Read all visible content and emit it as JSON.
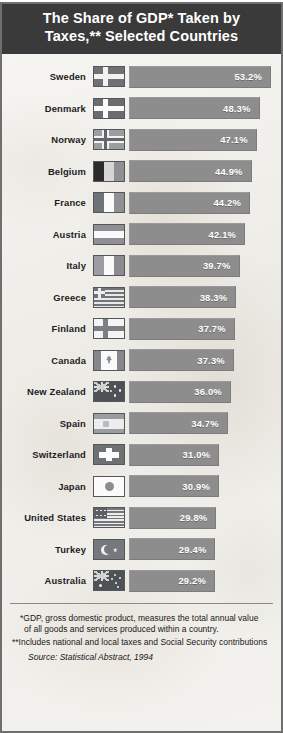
{
  "title": {
    "line1": "The Share of GDP* Taken by",
    "line2": "Taxes,** Selected Countries"
  },
  "colors": {
    "title_bar": "#3a3a3a",
    "bar": "#8d8d8d",
    "background": "#f2f1ee",
    "frame": "#6f6f6f",
    "value_text": "#ffffff"
  },
  "notes": {
    "footnote1_a": "*GDP, gross domestic product, measures the total annual value",
    "footnote1_b": "of all goods and services produced within a country.",
    "footnote2": "**Includes national and local taxes and Social Security contributions",
    "source_prefix": "Source: ",
    "source_title": "Statistical Abstract",
    "source_year": ", 1994"
  },
  "chart_data": {
    "type": "bar",
    "orientation": "horizontal",
    "title": "The Share of GDP* Taken by Taxes,** Selected Countries",
    "xlabel": "",
    "ylabel": "",
    "xlim": [
      0,
      53.2
    ],
    "grid": false,
    "legend": false,
    "unit": "%",
    "categories": [
      "Sweden",
      "Denmark",
      "Norway",
      "Belgium",
      "France",
      "Austria",
      "Italy",
      "Greece",
      "Finland",
      "Canada",
      "New Zealand",
      "Spain",
      "Switzerland",
      "Japan",
      "United States",
      "Turkey",
      "Australia"
    ],
    "values": [
      53.2,
      48.3,
      47.1,
      44.9,
      44.2,
      42.1,
      39.7,
      38.3,
      37.7,
      37.3,
      36.0,
      34.7,
      31.0,
      30.9,
      29.8,
      29.4,
      29.2
    ],
    "rows": [
      {
        "country": "Sweden",
        "value": 53.2,
        "label": "53.2%",
        "flag": "sweden-flag"
      },
      {
        "country": "Denmark",
        "value": 48.3,
        "label": "48.3%",
        "flag": "denmark-flag"
      },
      {
        "country": "Norway",
        "value": 47.1,
        "label": "47.1%",
        "flag": "norway-flag"
      },
      {
        "country": "Belgium",
        "value": 44.9,
        "label": "44.9%",
        "flag": "belgium-flag"
      },
      {
        "country": "France",
        "value": 44.2,
        "label": "44.2%",
        "flag": "france-flag"
      },
      {
        "country": "Austria",
        "value": 42.1,
        "label": "42.1%",
        "flag": "austria-flag"
      },
      {
        "country": "Italy",
        "value": 39.7,
        "label": "39.7%",
        "flag": "italy-flag"
      },
      {
        "country": "Greece",
        "value": 38.3,
        "label": "38.3%",
        "flag": "greece-flag"
      },
      {
        "country": "Finland",
        "value": 37.7,
        "label": "37.7%",
        "flag": "finland-flag"
      },
      {
        "country": "Canada",
        "value": 37.3,
        "label": "37.3%",
        "flag": "canada-flag"
      },
      {
        "country": "New Zealand",
        "value": 36.0,
        "label": "36.0%",
        "flag": "new-zealand-flag"
      },
      {
        "country": "Spain",
        "value": 34.7,
        "label": "34.7%",
        "flag": "spain-flag"
      },
      {
        "country": "Switzerland",
        "value": 31.0,
        "label": "31.0%",
        "flag": "switzerland-flag"
      },
      {
        "country": "Japan",
        "value": 30.9,
        "label": "30.9%",
        "flag": "japan-flag"
      },
      {
        "country": "United States",
        "value": 29.8,
        "label": "29.8%",
        "flag": "united-states-flag"
      },
      {
        "country": "Turkey",
        "value": 29.4,
        "label": "29.4%",
        "flag": "turkey-flag"
      },
      {
        "country": "Australia",
        "value": 29.2,
        "label": "29.2%",
        "flag": "australia-flag"
      }
    ]
  }
}
